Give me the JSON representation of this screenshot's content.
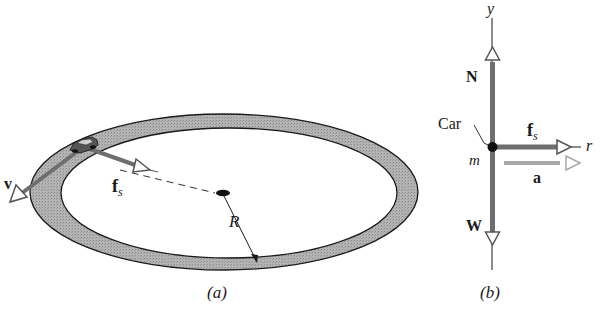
{
  "panel_a": {
    "caption": "(a)",
    "labels": {
      "velocity": "v",
      "friction": "f",
      "friction_sub": "s",
      "radius": "R"
    }
  },
  "panel_b": {
    "caption": "(b)",
    "labels": {
      "y_axis": "y",
      "r_axis": "r",
      "normal": "N",
      "weight": "W",
      "friction": "f",
      "friction_sub": "s",
      "acceleration": "a",
      "car": "Car",
      "mass": "m"
    }
  },
  "colors": {
    "track_fill": "#a9a9a9",
    "vector": "#6e6e6e",
    "accel_vector": "#a8a8a8",
    "line": "#1a1a1a"
  }
}
